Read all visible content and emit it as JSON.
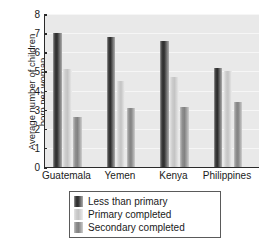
{
  "chart_data": {
    "type": "bar",
    "title": "",
    "xlabel": "",
    "ylabel": "Average number of children\nborn per woman",
    "categories": [
      "Guatemala",
      "Yemen",
      "Kenya",
      "Philippines"
    ],
    "series": [
      {
        "name": "Less than primary",
        "values": [
          7.0,
          6.8,
          6.6,
          5.2
        ],
        "color": "#2e2e2e"
      },
      {
        "name": "Primary completed",
        "values": [
          5.1,
          4.5,
          4.7,
          5.0
        ],
        "color": "#c4c4c4"
      },
      {
        "name": "Secondary completed",
        "values": [
          2.6,
          3.1,
          3.15,
          3.4
        ],
        "color": "#828282"
      }
    ],
    "ylim": [
      0,
      8
    ],
    "yticks": [
      0,
      1,
      2,
      3,
      4,
      5,
      6,
      7,
      8
    ],
    "ytick_labels": [
      "0",
      "1",
      "2",
      "3",
      "4",
      "5",
      "6",
      "7",
      "8"
    ],
    "grid": true,
    "legend_position": "below-center",
    "plot_background": "#e9e9e9",
    "axis_color": "#2b2b2b"
  },
  "legend": {
    "items": [
      {
        "label": "Less than primary"
      },
      {
        "label": "Primary completed"
      },
      {
        "label": "Secondary completed"
      }
    ]
  }
}
